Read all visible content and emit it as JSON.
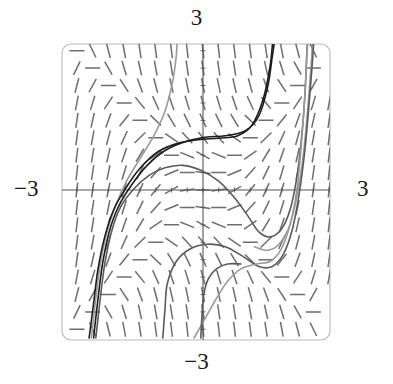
{
  "figure": {
    "kind": "slope-field-with-solution-curves",
    "background": "#ffffff",
    "frame": {
      "x": 62,
      "y": 44,
      "width": 268,
      "height": 296,
      "corner_radius": 9,
      "stroke": "#b9b9b9",
      "stroke_width": 1.1
    },
    "axes": {
      "origin_px": [
        203,
        190
      ],
      "stroke": "#555555",
      "stroke_width": 1.1,
      "tick_length": 5,
      "tick_count_x": 17,
      "tick_count_y": 17
    },
    "labels": {
      "top": "3",
      "bottom": "−3",
      "left": "−3",
      "right": "3"
    },
    "slope_field": {
      "stroke": "#6e6e6e",
      "stroke_width": 1.5,
      "dash_length": 15,
      "cols": 17,
      "rows": 17,
      "x_range": [
        -3,
        3
      ],
      "y_range": [
        -3,
        3
      ]
    },
    "curves": {
      "dark_stroke": "#1c1c1c",
      "mid_stroke": "#5a5a5a",
      "light_stroke": "#9a9a9a",
      "stroke_width": 1.6
    }
  },
  "chart_data": {
    "type": "line",
    "title": "",
    "xlabel": "",
    "ylabel": "",
    "xlim": [
      -3,
      3
    ],
    "ylim": [
      -3,
      3
    ],
    "xticks": [
      -3,
      3
    ],
    "yticks": [
      -3,
      3
    ],
    "xticklabels": [
      "−3",
      "3"
    ],
    "yticklabels": [
      "−3",
      "3"
    ],
    "grid": false,
    "legend": "none",
    "annotations": [
      {
        "text": "3",
        "position": "top-axis-end"
      },
      {
        "text": "−3",
        "position": "bottom-axis-end"
      },
      {
        "text": "−3",
        "position": "left-axis-end"
      },
      {
        "text": "3",
        "position": "right-axis-end"
      }
    ],
    "vector_field": {
      "description": "Direction field of dy/dx = x^2 - y^2; dashes are near vertical for |x| large, shallow or negative inside the band |y| > |x| near the origin",
      "slope_formula": "x^2 - y^2",
      "sample_cols": 17,
      "sample_rows": 17
    },
    "series": [
      {
        "name": "curve-dark-upper",
        "shade": "dark",
        "points": [
          [
            -2.45,
            -3.0
          ],
          [
            -2.35,
            -2.2
          ],
          [
            -2.25,
            -1.5
          ],
          [
            -2.1,
            -0.85
          ],
          [
            -1.9,
            -0.35
          ],
          [
            -1.6,
            0.1
          ],
          [
            -1.25,
            0.5
          ],
          [
            -0.85,
            0.8
          ],
          [
            -0.4,
            0.98
          ],
          [
            0.05,
            1.07
          ],
          [
            0.5,
            1.1
          ],
          [
            0.95,
            1.2
          ],
          [
            1.25,
            1.5
          ],
          [
            1.45,
            2.1
          ],
          [
            1.55,
            2.7
          ],
          [
            1.6,
            3.0
          ]
        ]
      },
      {
        "name": "curve-light-upper",
        "shade": "light",
        "points": [
          [
            -2.5,
            -3.0
          ],
          [
            -2.4,
            -2.2
          ],
          [
            -2.3,
            -1.5
          ],
          [
            -2.15,
            -0.85
          ],
          [
            -1.95,
            -0.3
          ],
          [
            -1.7,
            0.2
          ],
          [
            -1.4,
            0.65
          ],
          [
            -1.1,
            1.1
          ],
          [
            -0.85,
            1.6
          ],
          [
            -0.68,
            2.2
          ],
          [
            -0.6,
            2.7
          ],
          [
            -0.58,
            3.0
          ]
        ]
      },
      {
        "name": "curve-mid-central-hump",
        "shade": "mid",
        "points": [
          [
            -2.4,
            -3.0
          ],
          [
            -2.3,
            -2.2
          ],
          [
            -2.2,
            -1.5
          ],
          [
            -2.05,
            -0.85
          ],
          [
            -1.85,
            -0.35
          ],
          [
            -1.55,
            0.02
          ],
          [
            -1.2,
            0.3
          ],
          [
            -0.85,
            0.45
          ],
          [
            -0.45,
            0.5
          ],
          [
            -0.05,
            0.4
          ],
          [
            0.35,
            0.18
          ],
          [
            0.7,
            -0.15
          ],
          [
            1.0,
            -0.52
          ],
          [
            1.25,
            -0.85
          ],
          [
            1.5,
            -0.95
          ],
          [
            1.75,
            -0.8
          ],
          [
            1.95,
            -0.4
          ],
          [
            2.1,
            0.25
          ],
          [
            2.2,
            1.0
          ],
          [
            2.28,
            1.9
          ],
          [
            2.32,
            2.7
          ],
          [
            2.34,
            3.0
          ]
        ]
      },
      {
        "name": "curve-light-right",
        "shade": "light",
        "points": [
          [
            1.15,
            -1.15
          ],
          [
            1.45,
            -1.22
          ],
          [
            1.7,
            -1.1
          ],
          [
            1.95,
            -0.7
          ],
          [
            2.12,
            -0.05
          ],
          [
            2.25,
            0.75
          ],
          [
            2.35,
            1.7
          ],
          [
            2.42,
            2.5
          ],
          [
            2.45,
            3.0
          ]
        ]
      },
      {
        "name": "curve-mid-lower",
        "shade": "mid",
        "points": [
          [
            -0.9,
            -3.0
          ],
          [
            -0.85,
            -2.4
          ],
          [
            -0.8,
            -1.9
          ],
          [
            -0.6,
            -1.45
          ],
          [
            -0.3,
            -1.2
          ],
          [
            0.1,
            -1.1
          ],
          [
            0.5,
            -1.15
          ],
          [
            0.9,
            -1.35
          ],
          [
            1.25,
            -1.55
          ],
          [
            1.55,
            -1.55
          ],
          [
            1.8,
            -1.3
          ],
          [
            2.0,
            -0.8
          ],
          [
            2.15,
            -0.1
          ],
          [
            2.28,
            0.8
          ],
          [
            2.38,
            1.8
          ],
          [
            2.45,
            2.6
          ],
          [
            2.48,
            3.0
          ]
        ]
      },
      {
        "name": "curve-dark-lower-left",
        "shade": "dark",
        "points": [
          [
            -2.55,
            -3.0
          ],
          [
            -2.45,
            -2.3
          ],
          [
            -2.35,
            -1.6
          ],
          [
            -2.2,
            -0.95
          ],
          [
            -2.0,
            -0.4
          ],
          [
            -1.72,
            0.05
          ],
          [
            -1.4,
            0.45
          ],
          [
            -1.0,
            0.78
          ],
          [
            -0.55,
            0.95
          ],
          [
            -0.1,
            1.02
          ],
          [
            0.35,
            1.05
          ],
          [
            0.78,
            1.1
          ],
          [
            1.1,
            1.32
          ],
          [
            1.35,
            1.85
          ],
          [
            1.5,
            2.5
          ],
          [
            1.56,
            3.0
          ]
        ]
      },
      {
        "name": "curve-light-bottom-rise",
        "shade": "light",
        "points": [
          [
            -0.2,
            -3.0
          ],
          [
            0.05,
            -2.6
          ],
          [
            0.3,
            -2.2
          ],
          [
            0.55,
            -1.85
          ],
          [
            0.85,
            -1.6
          ],
          [
            1.2,
            -1.5
          ],
          [
            1.5,
            -1.45
          ],
          [
            1.75,
            -1.2
          ],
          [
            1.95,
            -0.7
          ],
          [
            2.1,
            0.0
          ],
          [
            2.2,
            0.9
          ],
          [
            2.28,
            1.9
          ],
          [
            2.33,
            2.8
          ],
          [
            2.35,
            3.0
          ]
        ]
      },
      {
        "name": "curve-mid-bottom-vertical",
        "shade": "mid",
        "points": [
          [
            -0.05,
            -3.0
          ],
          [
            -0.02,
            -2.5
          ],
          [
            0.02,
            -2.1
          ],
          [
            0.12,
            -1.8
          ],
          [
            0.3,
            -1.6
          ],
          [
            0.55,
            -1.5
          ],
          [
            0.85,
            -1.5
          ]
        ]
      }
    ]
  }
}
